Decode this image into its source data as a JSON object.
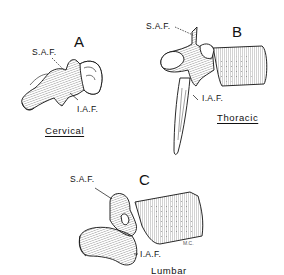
{
  "figure": {
    "panels": [
      {
        "id": "A",
        "letter": "A",
        "region": "Cervical",
        "labels": {
          "superior": "S.A.F.",
          "inferior": "I.A.F."
        }
      },
      {
        "id": "B",
        "letter": "B",
        "region": "Thoracic",
        "labels": {
          "superior": "S.A.F.",
          "inferior": "I.A.F."
        }
      },
      {
        "id": "C",
        "letter": "C",
        "region": "Lumbar",
        "labels": {
          "superior": "S.A.F.",
          "inferior": "I.A.F."
        },
        "artist_initials": "M.C."
      }
    ],
    "colors": {
      "ink": "#111111",
      "background": "#ffffff"
    }
  }
}
